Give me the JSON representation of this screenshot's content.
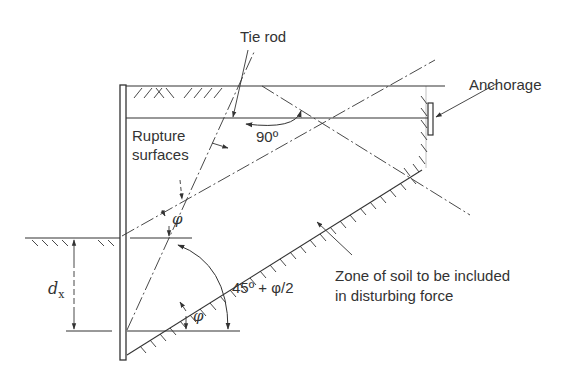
{
  "diagram": {
    "labels": {
      "tie_rod": "Tie rod",
      "anchorage": "Anchorage",
      "rupture_line1": "Rupture",
      "rupture_line2": "surfaces",
      "angle_90": "90º",
      "phi_upper": "φ",
      "phi_lower": "φ",
      "angle_45": "45º + φ/2",
      "dx_main": "d",
      "dx_sub": "x",
      "zone_line1": "Zone of soil to be included",
      "zone_line2": "in disturbing force"
    },
    "colors": {
      "ink": "#333333",
      "background": "#ffffff"
    }
  }
}
